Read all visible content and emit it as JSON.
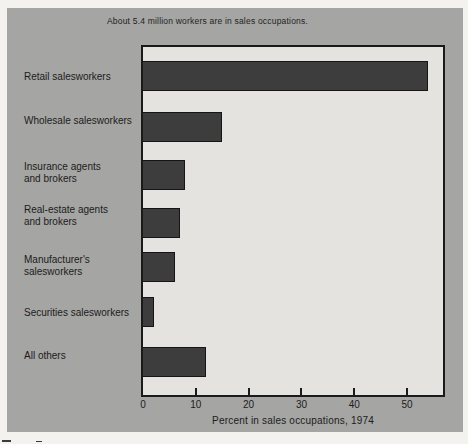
{
  "figure": {
    "title": "About 5.4 million workers are in sales occupations.",
    "colors": {
      "page_bg": "#f3f2ee",
      "figure_bg": "#a5a5a3",
      "plot_bg": "#e4e3df",
      "bar": "#3d3d3d",
      "frame": "#1a1a1a",
      "text": "#1c1c1c"
    }
  },
  "chart_data": {
    "type": "bar",
    "orientation": "horizontal",
    "title": "About 5.4 million workers are in sales occupations.",
    "categories": [
      "Retail salesworkers",
      "Wholesale salesworkers",
      "Insurance agents\nand brokers",
      "Real-estate agents\nand brokers",
      "Manufacturer's\nsalesworkers",
      "Securities salesworkers",
      "All others"
    ],
    "values": [
      54,
      15,
      8,
      7,
      6,
      2,
      12
    ],
    "unit": "percent",
    "xlabel": "Percent in sales occupations, 1974",
    "xticks": [
      0,
      10,
      20,
      30,
      40,
      50
    ],
    "xlim": [
      0,
      56.8
    ],
    "grid": false,
    "legend": null
  }
}
